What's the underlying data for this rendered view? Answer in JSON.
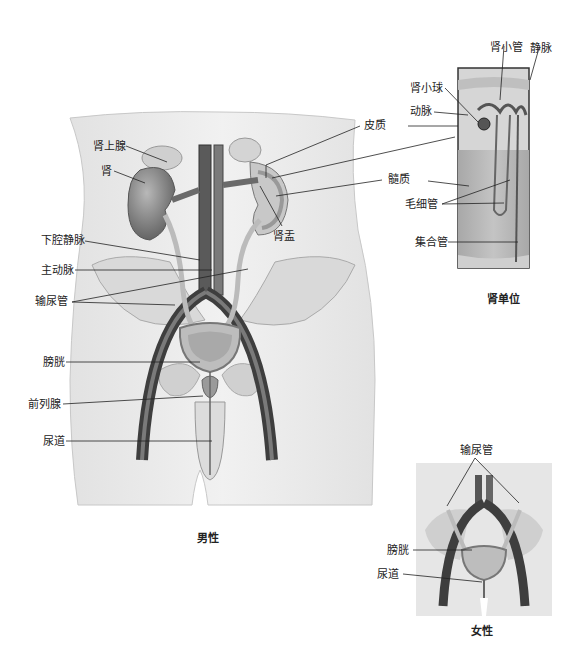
{
  "male_figure": {
    "caption": "男性",
    "labels": {
      "adrenal_gland": "肾上腺",
      "kidney": "肾",
      "renal_pelvis": "肾盂",
      "inferior_vena_cava": "下腔静脉",
      "aorta": "主动脉",
      "ureter": "输尿管",
      "bladder": "膀胱",
      "prostate": "前列腺",
      "urethra": "尿道"
    }
  },
  "kidney_callouts": {
    "cortex": "皮质",
    "medulla": "髓质"
  },
  "nephron_inset": {
    "caption": "肾单位",
    "labels": {
      "renal_tubule": "肾小管",
      "vein": "静脉",
      "glomerulus": "肾小球",
      "artery": "动脉",
      "capillaries": "毛细管",
      "collecting_duct": "集合管"
    }
  },
  "female_figure": {
    "caption": "女性",
    "labels": {
      "ureter": "输尿管",
      "bladder": "膀胱",
      "urethra": "尿道"
    }
  },
  "colors": {
    "skin": "#ececec",
    "bone": "#d9d9d9",
    "vessel_dark": "#4a4a4a",
    "organ": "#8f8f8f",
    "medulla": "#b4b4b4",
    "line": "#222222"
  }
}
